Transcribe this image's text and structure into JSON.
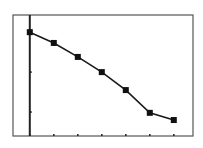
{
  "chart_data": {
    "type": "line",
    "title": "",
    "xlabel": "",
    "ylabel": "",
    "x": [
      0,
      1,
      2,
      3,
      4,
      5,
      6
    ],
    "series": [
      {
        "name": "data",
        "values": [
          3.0,
          2.73,
          2.38,
          2.0,
          1.55,
          0.98,
          0.8
        ],
        "marker": "square"
      }
    ],
    "xlim": [
      -0.7,
      6.8
    ],
    "ylim": [
      0.4,
      3.43
    ],
    "x_ticks": [
      0,
      1,
      2,
      3,
      4,
      5,
      6
    ],
    "y_ticks": [
      1,
      2,
      3
    ],
    "tick_labels_shown": false,
    "grid": false,
    "legend": "none",
    "style": "graphing-calculator window",
    "colors": {
      "line": "#1a1a1a",
      "marker": "#111111",
      "frame": "#555555",
      "axis": "#222222",
      "background": "#ffffff"
    }
  }
}
